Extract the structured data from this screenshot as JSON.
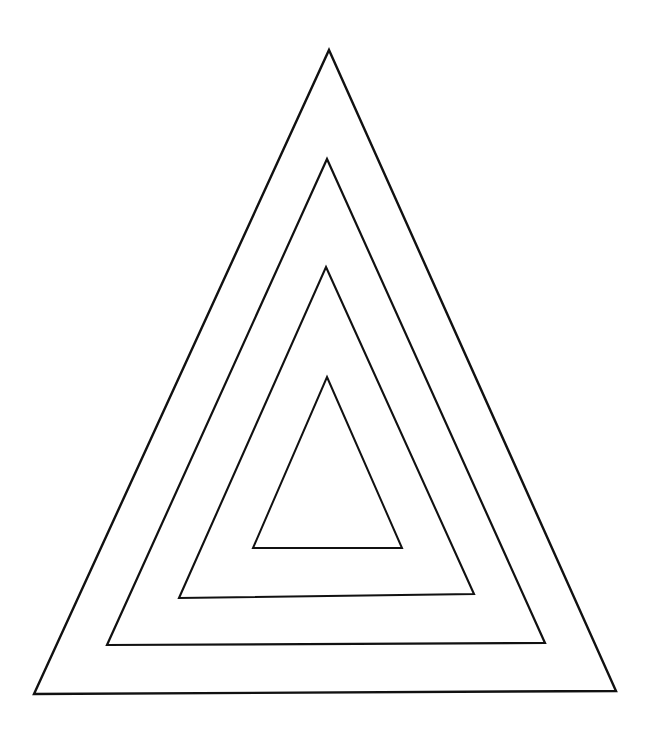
{
  "page": {
    "width": 649,
    "height": 736,
    "background_color": "#ffffff",
    "stroke_color": "#111111"
  },
  "figure": {
    "name": "nested-triangles",
    "shape_count": 4,
    "fill": "none",
    "shapes": [
      {
        "id": "triangle-1-outer",
        "label": "Outer triangle",
        "stroke_width": 2.4,
        "points": "329,50 616,691 34,694",
        "apex": [
          329,
          50
        ],
        "bottom_left": [
          34,
          694
        ],
        "bottom_right": [
          616,
          691
        ]
      },
      {
        "id": "triangle-2",
        "label": "Second triangle",
        "stroke_width": 2.2,
        "points": "327,159 545,643 107,645",
        "apex": [
          327,
          159
        ],
        "bottom_left": [
          107,
          645
        ],
        "bottom_right": [
          545,
          643
        ]
      },
      {
        "id": "triangle-3",
        "label": "Third triangle",
        "stroke_width": 2.1,
        "points": "326,267 474,594 179,598",
        "apex": [
          326,
          267
        ],
        "bottom_left": [
          179,
          598
        ],
        "bottom_right": [
          474,
          594
        ]
      },
      {
        "id": "triangle-4-inner",
        "label": "Innermost triangle",
        "stroke_width": 2.0,
        "points": "327,377 402,548 253,548",
        "apex": [
          327,
          377
        ],
        "bottom_left": [
          253,
          548
        ],
        "bottom_right": [
          402,
          548
        ]
      }
    ]
  },
  "chart_data": {
    "type": "diagram",
    "series": [
      {
        "name": "Outer triangle",
        "vertices": [
          [
            329,
            50
          ],
          [
            616,
            691
          ],
          [
            34,
            694
          ]
        ]
      },
      {
        "name": "Second triangle",
        "vertices": [
          [
            327,
            159
          ],
          [
            545,
            643
          ],
          [
            107,
            645
          ]
        ]
      },
      {
        "name": "Third triangle",
        "vertices": [
          [
            326,
            267
          ],
          [
            474,
            594
          ],
          [
            179,
            598
          ]
        ]
      },
      {
        "name": "Innermost triangle",
        "vertices": [
          [
            327,
            377
          ],
          [
            402,
            548
          ],
          [
            253,
            548
          ]
        ]
      }
    ]
  }
}
